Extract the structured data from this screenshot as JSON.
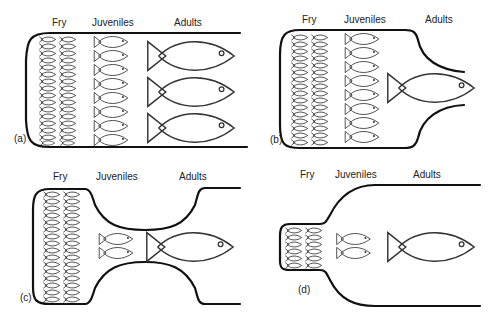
{
  "figure": {
    "stage_labels": {
      "fry": "Fry",
      "juveniles": "Juveniles",
      "adults": "Adults"
    },
    "panels": [
      {
        "id": "a",
        "label": "(a)",
        "fry_columns": 2,
        "fry_per_column": 16,
        "juveniles": 8,
        "adults": 3,
        "shape": "straight-channel"
      },
      {
        "id": "b",
        "label": "(b)",
        "fry_columns": 2,
        "fry_per_column": 16,
        "juveniles": 8,
        "adults": 1,
        "shape": "narrowing-outlet"
      },
      {
        "id": "c",
        "label": "(c)",
        "fry_columns": 2,
        "fry_per_column": 16,
        "juveniles": 2,
        "adults": 1,
        "shape": "constricted-neck"
      },
      {
        "id": "d",
        "label": "(d)",
        "fry_columns": 2,
        "fry_per_column": 6,
        "juveniles": 2,
        "adults": 1,
        "shape": "small-nursery-pocket"
      }
    ]
  }
}
